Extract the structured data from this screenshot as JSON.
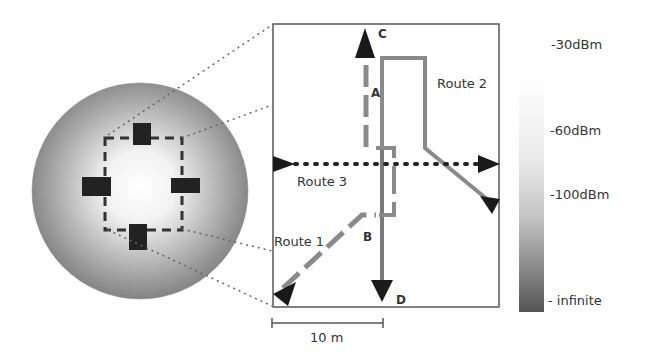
{
  "diagram": {
    "routes": [
      {
        "id": "route1",
        "label": "Route 1",
        "style": "dashed"
      },
      {
        "id": "route2",
        "label": "Route 2",
        "style": "solid"
      },
      {
        "id": "route3",
        "label": "Route 3",
        "style": "dotted"
      }
    ],
    "points": {
      "A": "A",
      "B": "B",
      "C": "C",
      "D": "D"
    },
    "scale_bar": "10 m",
    "colorbar": {
      "ticks": [
        "-30dBm",
        "-60dBm",
        "-100dBm",
        "- infinite"
      ]
    },
    "colors": {
      "route_gray": "#8a8a8a",
      "arrow": "#1a1a1a",
      "frame": "#555555"
    }
  }
}
